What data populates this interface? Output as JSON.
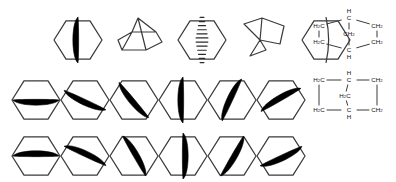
{
  "figure": {
    "background_color": "#ffffff",
    "bond_color": "#1a1a1a",
    "wedge_color": "#000000",
    "hash_color": "#2b2b2b",
    "line_color": "#3a3a3a",
    "width": 396,
    "height": 182
  },
  "rows": [
    {
      "name": "top-row",
      "y": 6,
      "items": [
        {
          "index": 0,
          "label": "hexagon-bold-wedge-vertical-bridge",
          "kind": "hexagon",
          "bridge": "bold-wedge",
          "rotation_deg": 90,
          "x": 78,
          "y": 10,
          "radius": 24
        },
        {
          "index": 1,
          "label": "perspective-norbornane-upright",
          "kind": "perspective",
          "variant": "upright",
          "x": 140,
          "y": 10
        },
        {
          "index": 2,
          "label": "hexagon-hashed-wedge-vertical-bridge",
          "kind": "hexagon",
          "bridge": "hashed-wedge",
          "rotation_deg": 90,
          "x": 202,
          "y": 10,
          "radius": 24
        },
        {
          "index": 3,
          "label": "perspective-norbornane-tilted",
          "kind": "perspective",
          "variant": "tilted",
          "x": 264,
          "y": 10
        },
        {
          "index": 4,
          "label": "hexagon-plain-line-bridge",
          "kind": "hexagon",
          "bridge": "plain-line",
          "rotation_deg": 90,
          "x": 326,
          "y": 10,
          "radius": 24
        }
      ]
    },
    {
      "name": "middle-row",
      "y": 68,
      "items": [
        {
          "index": 0,
          "label": "hexagon-wedge-rot-000",
          "kind": "hexagon",
          "bridge": "bold-wedge",
          "rotation_deg": 0,
          "x": 36,
          "y": 70,
          "radius": 24
        },
        {
          "index": 1,
          "label": "hexagon-wedge-rot-025",
          "kind": "hexagon",
          "bridge": "bold-wedge",
          "rotation_deg": 25,
          "x": 85,
          "y": 70,
          "radius": 24
        },
        {
          "index": 2,
          "label": "hexagon-wedge-rot-050",
          "kind": "hexagon",
          "bridge": "bold-wedge",
          "rotation_deg": 50,
          "x": 134,
          "y": 70,
          "radius": 24
        },
        {
          "index": 3,
          "label": "hexagon-wedge-rot-090",
          "kind": "hexagon",
          "bridge": "bold-wedge",
          "rotation_deg": 90,
          "x": 183,
          "y": 70,
          "radius": 24
        },
        {
          "index": 4,
          "label": "hexagon-wedge-rot-115",
          "kind": "hexagon",
          "bridge": "bold-wedge",
          "rotation_deg": 115,
          "x": 232,
          "y": 70,
          "radius": 24
        },
        {
          "index": 5,
          "label": "hexagon-wedge-rot-150",
          "kind": "hexagon",
          "bridge": "bold-wedge",
          "rotation_deg": 150,
          "x": 281,
          "y": 70,
          "radius": 24
        }
      ]
    },
    {
      "name": "bottom-row",
      "y": 126,
      "items": [
        {
          "index": 0,
          "label": "hexagon-wedge-rot-180",
          "kind": "hexagon",
          "bridge": "bold-wedge",
          "rotation_deg": 180,
          "x": 36,
          "y": 126,
          "radius": 24
        },
        {
          "index": 1,
          "label": "hexagon-wedge-rot-205",
          "kind": "hexagon",
          "bridge": "bold-wedge",
          "rotation_deg": 205,
          "x": 85,
          "y": 126,
          "radius": 24
        },
        {
          "index": 2,
          "label": "hexagon-wedge-rot-240",
          "kind": "hexagon",
          "bridge": "bold-wedge",
          "rotation_deg": 240,
          "x": 134,
          "y": 126,
          "radius": 24
        },
        {
          "index": 3,
          "label": "hexagon-wedge-rot-270",
          "kind": "hexagon",
          "bridge": "bold-wedge",
          "rotation_deg": 270,
          "x": 183,
          "y": 126,
          "radius": 24
        },
        {
          "index": 4,
          "label": "hexagon-wedge-rot-300",
          "kind": "hexagon",
          "bridge": "bold-wedge",
          "rotation_deg": 300,
          "x": 232,
          "y": 126,
          "radius": 24
        },
        {
          "index": 5,
          "label": "hexagon-wedge-rot-335",
          "kind": "hexagon",
          "bridge": "bold-wedge",
          "rotation_deg": 335,
          "x": 281,
          "y": 126,
          "radius": 24
        }
      ]
    }
  ],
  "formulas": [
    {
      "name": "condensed-formula-bridged",
      "layout": "bridged-diamond",
      "x": 305,
      "y": 4,
      "width": 88,
      "height": 52,
      "atoms": [
        {
          "id": "c-top",
          "main": "C",
          "sub": "",
          "extra_h": "H",
          "extra_pos": "above",
          "x": 44,
          "y": 14
        },
        {
          "id": "c-left-upper",
          "main": "H",
          "sub": "2",
          "tail": "C",
          "x": 14,
          "y": 22
        },
        {
          "id": "c-right-upper",
          "main": "C",
          "sub": "",
          "tail": "H",
          "tail_sub": "2",
          "x": 72,
          "y": 22
        },
        {
          "id": "c-bridge",
          "main": "C",
          "sub": "",
          "tail": "H",
          "tail_sub": "2",
          "x": 44,
          "y": 30
        },
        {
          "id": "c-left-lower",
          "main": "H",
          "sub": "2",
          "tail": "C",
          "x": 14,
          "y": 38
        },
        {
          "id": "c-right-lower",
          "main": "C",
          "sub": "",
          "tail": "H",
          "tail_sub": "2",
          "x": 72,
          "y": 38
        },
        {
          "id": "c-bottom",
          "main": "C",
          "sub": "",
          "extra_h": "H",
          "extra_pos": "below",
          "x": 44,
          "y": 46
        }
      ],
      "atom_labels": [
        "H C",
        "H2C",
        "CH2",
        "CH2",
        "H2C",
        "CH2",
        "C H"
      ]
    },
    {
      "name": "condensed-formula-square",
      "layout": "square-with-center-bridge",
      "x": 305,
      "y": 66,
      "width": 88,
      "height": 52,
      "atoms": [
        {
          "id": "c-top-left",
          "main": "H",
          "sub": "2",
          "tail": "C",
          "x": 14,
          "y": 14
        },
        {
          "id": "c-top-center",
          "main": "C",
          "sub": "",
          "extra_h": "H",
          "extra_pos": "above",
          "x": 44,
          "y": 14
        },
        {
          "id": "c-top-right",
          "main": "C",
          "sub": "",
          "tail": "H",
          "tail_sub": "2",
          "x": 72,
          "y": 14
        },
        {
          "id": "c-center",
          "main": "H",
          "sub": "2",
          "tail": "C",
          "x": 40,
          "y": 30
        },
        {
          "id": "c-bot-left",
          "main": "H",
          "sub": "2",
          "tail": "C",
          "x": 14,
          "y": 44
        },
        {
          "id": "c-bot-center",
          "main": "C",
          "sub": "",
          "extra_h": "H",
          "extra_pos": "below",
          "x": 44,
          "y": 44
        },
        {
          "id": "c-bot-right",
          "main": "C",
          "sub": "",
          "tail": "H",
          "tail_sub": "2",
          "x": 72,
          "y": 44
        }
      ],
      "atom_labels": [
        "H2C",
        "C H",
        "CH2",
        "H2C",
        "H2C",
        "C H",
        "CH2"
      ]
    }
  ],
  "text_tokens": {
    "H": "H",
    "C": "C",
    "two": "2",
    "H2C": "H2C",
    "CH2": "CH2",
    "CH": "CH"
  }
}
